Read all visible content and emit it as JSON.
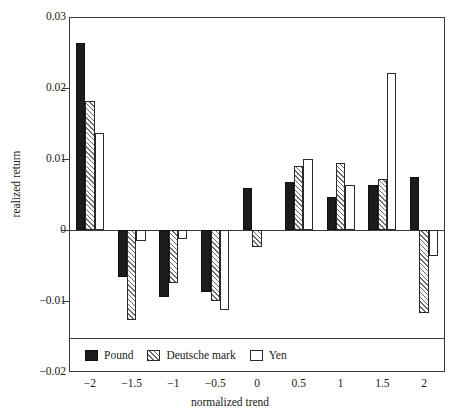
{
  "chart_data": {
    "type": "bar",
    "title": "",
    "xlabel": "normalized trend",
    "ylabel": "realized return",
    "categories": [
      "-2",
      "-1.5",
      "-1",
      "-0.5",
      "0",
      "0.5",
      "1",
      "1.5",
      "2"
    ],
    "xticklabels": [
      "−2",
      "−1.5",
      "−1",
      "−0.5",
      "0",
      "0.5",
      "1",
      "1.5",
      "2"
    ],
    "yticklabels": [
      "0.03",
      "0.02",
      "0.01",
      "0",
      "−0.01",
      "−0.02"
    ],
    "ytickvalues": [
      0.03,
      0.02,
      0.01,
      0,
      -0.01,
      -0.02
    ],
    "ylim": [
      -0.02,
      0.03
    ],
    "xlim": [
      -2.25,
      2.25
    ],
    "grid": false,
    "legend_position": "bottom-left-inside",
    "series": [
      {
        "name": "Pound",
        "color": "#1c1c1c",
        "fill": "solid-black",
        "values": [
          0.0264,
          -0.0066,
          -0.0094,
          -0.0088,
          0.0059,
          0.0068,
          0.0046,
          0.0064,
          0.0075
        ]
      },
      {
        "name": "Deutsche mark",
        "color": "#6e6e6e",
        "fill": "diagonal-hatch",
        "values": [
          0.0182,
          -0.0127,
          -0.0075,
          -0.01,
          -0.0024,
          0.009,
          0.0095,
          0.0072,
          -0.0117
        ]
      },
      {
        "name": "Yen",
        "color": "#ffffff",
        "fill": "white-outline",
        "values": [
          0.0137,
          -0.0016,
          -0.0013,
          -0.0113,
          0.0,
          0.01,
          0.0063,
          0.0221,
          -0.0036
        ]
      }
    ]
  },
  "legend": {
    "items": [
      {
        "label": "Pound",
        "swatch": "solid-black-swatch"
      },
      {
        "label": "Deutsche mark",
        "swatch": "hatched-swatch"
      },
      {
        "label": "Yen",
        "swatch": "white-outline-swatch"
      }
    ]
  }
}
